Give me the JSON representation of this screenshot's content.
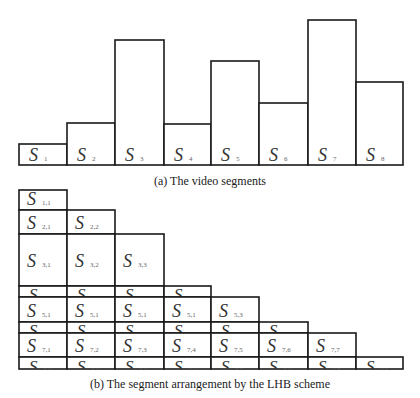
{
  "chart_data": {
    "type": "bar",
    "title": "",
    "caption_a": "(a) The video segments",
    "caption_b": "(b) The segment arrangement by the LHB scheme",
    "categories": [
      "S1",
      "S2",
      "S3",
      "S4",
      "S5",
      "S6",
      "S7",
      "S8"
    ],
    "subscripts": [
      "1",
      "2",
      "3",
      "4",
      "5",
      "6",
      "7",
      "8"
    ],
    "values": [
      21,
      42,
      125,
      41,
      104,
      62,
      145,
      83
    ],
    "xlabel": "",
    "ylabel": "",
    "grid": false,
    "legend": null
  },
  "arrangement": {
    "rows": [
      {
        "row": 1,
        "height": "normal",
        "cells": [
          "1,1"
        ]
      },
      {
        "row": 2,
        "height": "normal",
        "cells": [
          "2,1",
          "2,2"
        ]
      },
      {
        "row": 3,
        "height": "tall",
        "cells": [
          "3,1",
          "3,2",
          "3,3"
        ]
      },
      {
        "row": 4,
        "height": "thin",
        "cells": [
          "4,1",
          "4,2",
          "4,3",
          "4,4"
        ]
      },
      {
        "row": 5,
        "height": "normal",
        "cells": [
          "5,1",
          "5,1",
          "5,1",
          "5,1",
          "5,3"
        ]
      },
      {
        "row": 6,
        "height": "thin",
        "cells": [
          "6,1",
          "6,2",
          "6,3",
          "6,4",
          "6,5",
          "6,6"
        ]
      },
      {
        "row": 7,
        "height": "normal",
        "cells": [
          "7,1",
          "7,2",
          "7,3",
          "7,4",
          "7,5",
          "7,6",
          "7,7"
        ]
      },
      {
        "row": 8,
        "height": "thin",
        "cells": [
          "8,1",
          "8,2",
          "8,3",
          "8,4",
          "8,5",
          "8,6",
          "8,7",
          "8,8"
        ]
      }
    ]
  },
  "symbol": "S"
}
